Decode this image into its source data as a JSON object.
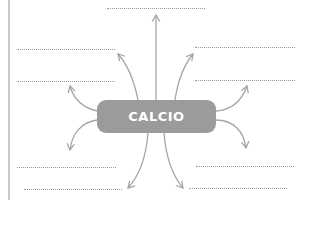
{
  "diagram": {
    "center_label": "CALCIO",
    "center_color": "#9b9b9b",
    "arrow_color": "#a5a5a5",
    "line_color": "#9a9a9a",
    "blanks": [
      {
        "id": "top",
        "x": 107,
        "y": 8,
        "w": 98
      },
      {
        "id": "left-upper",
        "x": 17,
        "y": 49,
        "w": 98
      },
      {
        "id": "left-lower",
        "x": 17,
        "y": 81,
        "w": 98
      },
      {
        "id": "right-upper",
        "x": 195,
        "y": 47,
        "w": 100
      },
      {
        "id": "right-lower",
        "x": 195,
        "y": 80,
        "w": 100
      },
      {
        "id": "left-bottom-1",
        "x": 17,
        "y": 167,
        "w": 99
      },
      {
        "id": "left-bottom-2",
        "x": 24,
        "y": 189,
        "w": 98
      },
      {
        "id": "right-bottom-1",
        "x": 196,
        "y": 166,
        "w": 98
      },
      {
        "id": "right-bottom-2",
        "x": 189,
        "y": 188,
        "w": 98
      }
    ]
  }
}
